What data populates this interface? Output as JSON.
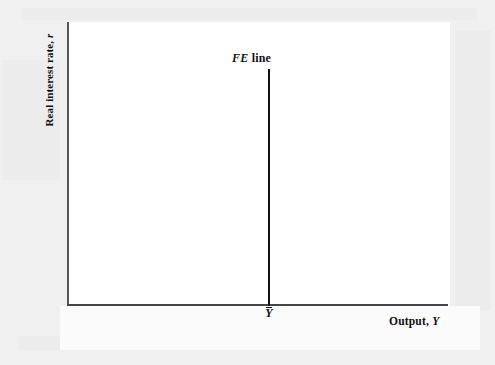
{
  "figure": {
    "name": "full-employment-line-diagram",
    "background_color": "#f0f0f0",
    "plot_background_color": "#ffffff"
  },
  "axes": {
    "y_label_text": "Real interest rate,",
    "y_label_symbol": "r",
    "x_label_text": "Output,",
    "x_label_symbol": "Y",
    "axis_color": "#45464a"
  },
  "annotations": {
    "fe_line_symbol": "FE",
    "fe_line_word": "line",
    "ybar_label": "Y",
    "line_color": "#141414"
  },
  "chart_data": {
    "type": "line",
    "title": "",
    "xlabel": "Output, Y",
    "ylabel": "Real interest rate, r",
    "xlim": [
      0,
      1
    ],
    "ylim": [
      0,
      1
    ],
    "grid": false,
    "legend": "none",
    "series": [
      {
        "name": "FE line",
        "label": "FE line",
        "description": "Vertical full-employment line at full-employment output Y-bar",
        "x": [
          0.527,
          0.527
        ],
        "y": [
          0.0,
          0.83
        ],
        "color": "#141414",
        "linewidth": 2
      }
    ],
    "annotations": [
      {
        "text": "FE line",
        "x": 0.45,
        "y": 0.9
      },
      {
        "text": "Ȳ",
        "x": 0.527,
        "y": -0.04
      }
    ],
    "x_ticks": [
      {
        "value": 0.527,
        "label": "Ȳ"
      }
    ],
    "y_ticks": []
  }
}
